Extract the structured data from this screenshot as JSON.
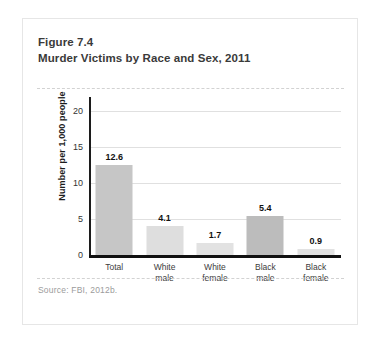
{
  "figure": {
    "title_line1": "Figure 7.4",
    "title_line2": "Murder Victims by Race and Sex, 2011",
    "source": "Source: FBI, 2012b."
  },
  "chart_data": {
    "type": "bar",
    "title": "Murder Victims by Race and Sex, 2011",
    "xlabel": "",
    "ylabel": "Number per 1,000 people",
    "categories": [
      "Total",
      "White male",
      "White female",
      "Black male",
      "Black female"
    ],
    "category_lines": [
      [
        "Total"
      ],
      [
        "White",
        "male"
      ],
      [
        "White",
        "female"
      ],
      [
        "Black",
        "male"
      ],
      [
        "Black",
        "female"
      ]
    ],
    "values": [
      12.6,
      4.1,
      1.7,
      5.4,
      0.9
    ],
    "value_labels": [
      "12.6",
      "4.1",
      "1.7",
      "5.4",
      "0.9"
    ],
    "bar_colors": [
      "#c6c6c6",
      "#dedede",
      "#e2e2e2",
      "#bcbcbc",
      "#e2e2e2"
    ],
    "ylim": [
      0,
      22
    ],
    "yticks": [
      0,
      5,
      10,
      15,
      20
    ],
    "ytick_labels": [
      "0",
      "5",
      "10",
      "15",
      "20"
    ],
    "grid": true,
    "legend": "none"
  },
  "colors": {
    "card_border": "#e6e6e6",
    "axis": "#111111",
    "gridline": "#e0e0e0",
    "title_text": "#3a3a3a",
    "source_text": "#9b9b9b"
  }
}
